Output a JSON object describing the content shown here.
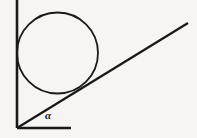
{
  "figure": {
    "background_color": "#f6f5f3",
    "stroke_color": "#1a1a1a",
    "labels": {
      "angle": "α"
    },
    "elements": {
      "vertical_axis": {
        "name": "vertical-line",
        "x1": 17,
        "y1": 0,
        "x2": 17,
        "y2": 128,
        "stroke_width": 2.6
      },
      "horizontal_axis": {
        "name": "horizontal-line",
        "x1": 17,
        "y1": 128,
        "x2": 71,
        "y2": 128,
        "stroke_width": 2.6
      },
      "inclined_ray": {
        "name": "inclined-line",
        "x1": 17,
        "y1": 128,
        "x2": 188,
        "y2": 23,
        "stroke_width": 2.3
      },
      "circle": {
        "name": "circle",
        "cx": 57.5,
        "cy": 53,
        "r": 40.5,
        "stroke_width": 1.8
      }
    },
    "angle_marker": {
      "vertex_x": 17,
      "vertex_y": 128,
      "label_x": 45,
      "label_y": 110
    }
  }
}
